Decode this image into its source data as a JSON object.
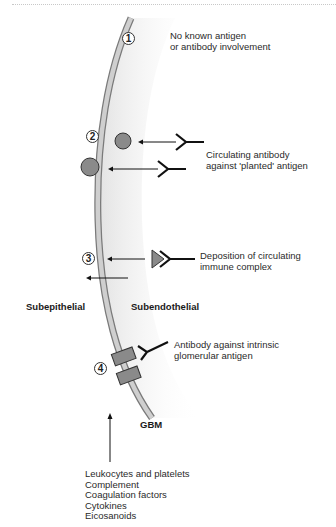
{
  "figure": {
    "markers": [
      {
        "id": "1",
        "label": "1"
      },
      {
        "id": "2",
        "label": "2"
      },
      {
        "id": "3",
        "label": "3"
      },
      {
        "id": "4",
        "label": "4"
      }
    ],
    "annotations": {
      "m1_line1": "No known antigen",
      "m1_line2": "or antibody involvement",
      "m2_line1": "Circulating antibody",
      "m2_line2": "against 'planted' antigen",
      "m3_line1": "Deposition of circulating",
      "m3_line2": "immune complex",
      "m4_line1": "Antibody against intrinsic",
      "m4_line2": "glomerular antigen"
    },
    "regions": {
      "left": "Subepithelial",
      "right": "Subendothelial",
      "membrane": "GBM"
    },
    "mediators": [
      "Leukocytes and platelets",
      "Complement",
      "Coagulation factors",
      "Cytokines",
      "Eicosanoids"
    ],
    "colors": {
      "membrane_fill": "#cfcfcf",
      "membrane_edge": "#7a7a7a",
      "antigen_fill": "#8a8a8a",
      "shade": "#e6e6e6"
    }
  }
}
